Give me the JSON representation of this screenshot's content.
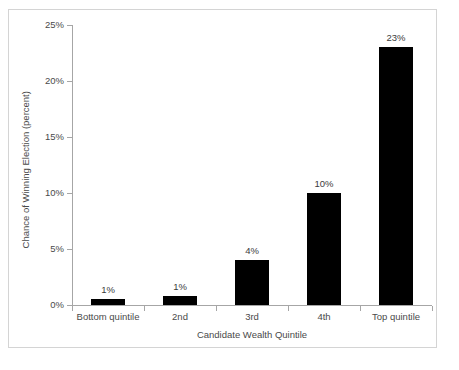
{
  "chart_data": {
    "type": "bar",
    "title": "",
    "subtitle": "",
    "xlabel": "Candidate Wealth Quintile",
    "ylabel": "Chance of Winning Election (percent)",
    "categories": [
      "Bottom quintile",
      "2nd",
      "3rd",
      "4th",
      "Top quintile"
    ],
    "values": [
      0.5,
      0.8,
      4,
      10,
      23
    ],
    "data_labels": [
      "1%",
      "1%",
      "4%",
      "10%",
      "23%"
    ],
    "ylim": [
      0,
      25
    ],
    "yticks": [
      0,
      5,
      10,
      15,
      20,
      25
    ],
    "ytick_labels": [
      "0%",
      "5%",
      "10%",
      "15%",
      "20%",
      "25%"
    ],
    "grid": false,
    "legend": false,
    "legend_position": "none",
    "bar_color": "#000000",
    "axis_color": "#a6a6a6",
    "text_color": "#4a4a4a",
    "frame_color": "#d4d4d4",
    "background_color": "#ffffff"
  }
}
